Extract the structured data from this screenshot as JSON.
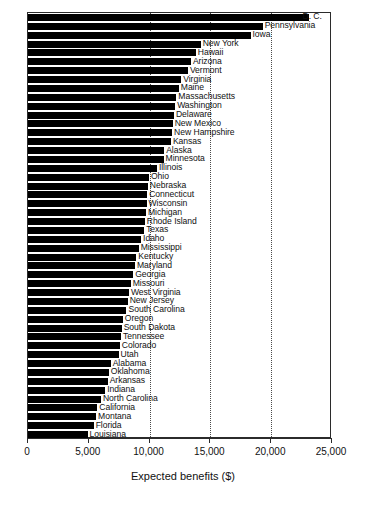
{
  "chart_data": {
    "type": "bar",
    "orientation": "horizontal",
    "title": "",
    "xlabel": "Expected benefits ($)",
    "ylabel": "",
    "xlim": [
      0,
      25000
    ],
    "xticks": [
      0,
      5000,
      10000,
      15000,
      20000,
      25000
    ],
    "xticklabels": [
      "0",
      "5,000",
      "10,000",
      "15,000",
      "20,000",
      "25,000"
    ],
    "gridlines": {
      "x": [
        10000,
        15000,
        20000
      ],
      "style": "dotted",
      "y": false
    },
    "legend": "none",
    "bar_color": "#000000",
    "categories": [
      "D. C.",
      "Pennsylvania",
      "Iowa",
      "New York",
      "Hawaii",
      "Arizona",
      "Vermont",
      "Virginia",
      "Maine",
      "Massachusetts",
      "Washington",
      "Delaware",
      "New Mexico",
      "New Hampshire",
      "Kansas",
      "Alaska",
      "Minnesota",
      "Illinois",
      "Ohio",
      "Nebraska",
      "Connecticut",
      "Wisconsin",
      "Michigan",
      "Rhode Island",
      "Texas",
      "Idaho",
      "Mississippi",
      "Kentucky",
      "Maryland",
      "Georgia",
      "Missouri",
      "West Virginia",
      "New Jersey",
      "South Carolina",
      "Oregon",
      "South Dakota",
      "Tennessee",
      "Colorado",
      "Utah",
      "Alabama",
      "Oklahoma",
      "Arkansas",
      "Indiana",
      "North Carolina",
      "California",
      "Montana",
      "Florida",
      "Louisiana"
    ],
    "values": [
      23100,
      19300,
      18300,
      14200,
      13800,
      13400,
      13150,
      12600,
      12400,
      12200,
      12100,
      12000,
      11900,
      11850,
      11750,
      11200,
      11150,
      10600,
      9950,
      9850,
      9800,
      9750,
      9700,
      9600,
      9550,
      9300,
      9100,
      8900,
      8800,
      8650,
      8450,
      8300,
      8200,
      8100,
      7800,
      7700,
      7650,
      7550,
      7450,
      6800,
      6650,
      6550,
      6350,
      6000,
      5700,
      5600,
      5400,
      4900
    ]
  },
  "axis": {
    "x_title": "Expected benefits ($)",
    "tick_labels": [
      "0",
      "5,000",
      "10,000",
      "15,000",
      "20,000",
      "25,000"
    ]
  }
}
